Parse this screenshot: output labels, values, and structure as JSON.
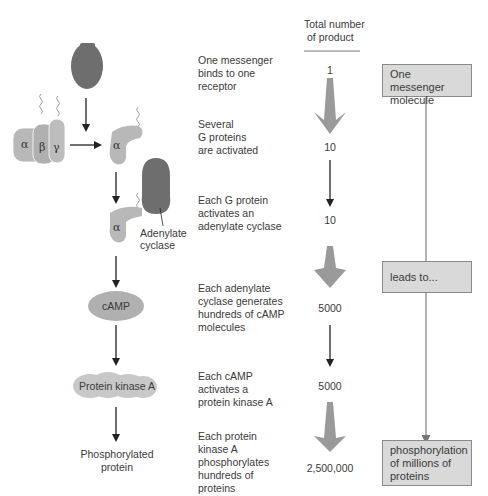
{
  "header": {
    "column_title": "Total number\nof product",
    "column_title_line1": "Total number",
    "column_title_line2": "of product"
  },
  "colors": {
    "messenger": "#6e6e6e",
    "g_protein": "#b8b8b8",
    "adenylate_cyclase": "#6e6e6e",
    "camp": "#b0b0b0",
    "pka": "#c8c8c8",
    "big_arrow": "#9a9a9a",
    "box_fill": "#d9d9d9",
    "line": "#555555"
  },
  "pathway": {
    "greek": {
      "alpha": "α",
      "beta": "β",
      "gamma": "γ"
    },
    "adenylate_label_1": "Adenylate",
    "adenylate_label_2": "cyclase",
    "camp_label": "cAMP",
    "pka_label": "Protein kinase A",
    "phospho_label_1": "Phosphorylated",
    "phospho_label_2": "protein"
  },
  "steps": [
    {
      "lines": [
        "One messenger",
        "binds to one",
        "receptor"
      ],
      "count": "1"
    },
    {
      "lines": [
        "Several",
        "G proteins",
        "are activated"
      ],
      "count": "10"
    },
    {
      "lines": [
        "Each G protein",
        "activates an",
        "adenylate cyclase"
      ],
      "count": "10"
    },
    {
      "lines": [
        "Each adenylate",
        "cyclase generates",
        "hundreds of cAMP",
        "molecules"
      ],
      "count": "5000"
    },
    {
      "lines": [
        "Each cAMP",
        "activates a",
        "protein kinase A"
      ],
      "count": "5000"
    },
    {
      "lines": [
        "Each protein",
        "kinase A",
        "phosphorylates",
        "hundreds of",
        "proteins"
      ],
      "count": "2,500,000"
    }
  ],
  "summary_boxes": [
    {
      "lines": [
        "One messenger",
        "molecule"
      ]
    },
    {
      "lines": [
        "leads to..."
      ]
    },
    {
      "lines": [
        "phosphorylation",
        "of millions of",
        "proteins"
      ]
    }
  ]
}
